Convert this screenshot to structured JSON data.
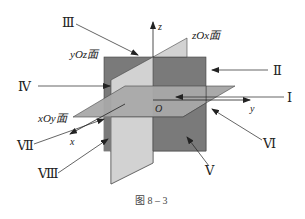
{
  "figure": {
    "caption": "图 8 – 3",
    "colors": {
      "yOz_plane": "#7a7a7a",
      "zOx_plane": "#d2d2d2",
      "xOy_plane": "#a9a9a9",
      "lines": "#222222",
      "background": "#ffffff"
    }
  },
  "axes": {
    "x": "x",
    "y": "y",
    "z": "z",
    "origin": "O"
  },
  "planes": {
    "yOz": "yOz面",
    "zOx": "zOx面",
    "xOy": "xOy面"
  },
  "octants": [
    {
      "id": "I",
      "label": "Ⅰ"
    },
    {
      "id": "II",
      "label": "Ⅱ"
    },
    {
      "id": "III",
      "label": "Ⅲ"
    },
    {
      "id": "IV",
      "label": "Ⅳ"
    },
    {
      "id": "V",
      "label": "Ⅴ"
    },
    {
      "id": "VI",
      "label": "Ⅵ"
    },
    {
      "id": "VII",
      "label": "Ⅶ"
    },
    {
      "id": "VIII",
      "label": "Ⅷ"
    }
  ]
}
